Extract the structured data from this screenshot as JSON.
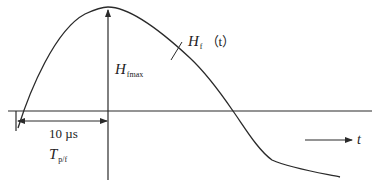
{
  "diagram": {
    "type": "waveform-sketch",
    "colors": {
      "line": "#2a2a2a",
      "background": "#ffffff"
    },
    "labels": {
      "peak_label_main": "H",
      "peak_label_sub": "fmax",
      "curve_label_main": "H",
      "curve_label_sub": "f",
      "curve_label_arg": "（t）",
      "rise_time_value": "10 µs",
      "rise_time_symbol_main": "T",
      "rise_time_symbol_sub": "p/f",
      "time_axis_label": "t"
    },
    "elements": {
      "horizontal_axis": "zero baseline",
      "vertical_marker": "peak amplitude arrow at t = 10 µs",
      "dimension_arrow": "rise time span from origin to peak",
      "direction_arrow": "time direction arrow"
    }
  }
}
